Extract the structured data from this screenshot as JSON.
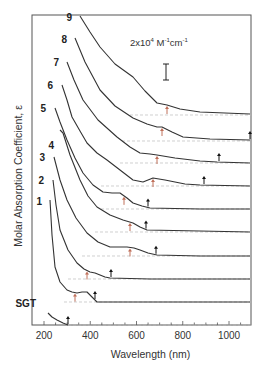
{
  "chart_data": {
    "type": "line",
    "title": "",
    "xlabel": "Wavelength (nm)",
    "ylabel": "Molar Absorption Coefficient, ε",
    "xlim": [
      150,
      1100
    ],
    "xticks": [
      200,
      400,
      600,
      800,
      1000
    ],
    "yticks": [],
    "grid": false,
    "legend": "curves labeled inline at left",
    "scale_bar": {
      "label_prefix": "2x10",
      "label_exp": "4",
      "label_units": " M",
      "units_exp1": "-1",
      "units_mid": "cm",
      "units_exp2": "-1",
      "value": "2x10^4 M^-1 cm^-1"
    },
    "annotations": "Red up-arrows mark absorption band maxima; black arrows mark absorption onsets. Curves offset vertically; dashed lines show each curve's zero baseline.",
    "series": [
      {
        "name": "9",
        "label_pos": [
          72,
          21
        ],
        "points": [
          [
            80,
            16
          ],
          [
            90,
            32
          ],
          [
            100,
            47
          ],
          [
            115,
            64
          ],
          [
            133,
            77
          ],
          [
            145,
            91
          ],
          [
            157,
            103
          ],
          [
            167,
            105
          ],
          [
            180,
            109
          ],
          [
            200,
            112
          ],
          [
            225,
            113
          ],
          [
            250,
            114
          ]
        ],
        "baseline_y": 115,
        "baseline_start_x": 130,
        "band_max_nm": 740,
        "band_max_x": 167,
        "onset_nm": null
      },
      {
        "name": "8",
        "label_pos": [
          67,
          43
        ],
        "points": [
          [
            75,
            38
          ],
          [
            85,
            62
          ],
          [
            100,
            90
          ],
          [
            115,
            106
          ],
          [
            133,
            118
          ],
          [
            147,
            124
          ],
          [
            157,
            127
          ],
          [
            162,
            127
          ],
          [
            172,
            132
          ],
          [
            183,
            137
          ],
          [
            210,
            139
          ],
          [
            250,
            140
          ]
        ],
        "baseline_y": 141,
        "baseline_start_x": 122,
        "band_max_nm": 710,
        "band_max_x": 162,
        "onset_nm": 1100,
        "onset_x": 250
      },
      {
        "name": "7",
        "label_pos": [
          59,
          66
        ],
        "points": [
          [
            67,
            62
          ],
          [
            74,
            80
          ],
          [
            83,
            100
          ],
          [
            98,
            120
          ],
          [
            117,
            137
          ],
          [
            130,
            147
          ],
          [
            140,
            153
          ],
          [
            150,
            154
          ],
          [
            157,
            155
          ],
          [
            175,
            158
          ],
          [
            200,
            161
          ],
          [
            217,
            162
          ],
          [
            250,
            163
          ]
        ],
        "baseline_y": 163,
        "baseline_start_x": 120,
        "band_max_nm": 690,
        "band_max_x": 157,
        "onset_nm": 960,
        "onset_x": 219
      },
      {
        "name": "6",
        "label_pos": [
          53,
          89
        ],
        "points": [
          [
            62,
            85
          ],
          [
            67,
            100
          ],
          [
            72,
            117
          ],
          [
            80,
            131
          ],
          [
            87,
            143
          ],
          [
            97,
            153
          ],
          [
            107,
            160
          ],
          [
            120,
            170
          ],
          [
            133,
            180
          ],
          [
            143,
            182
          ],
          [
            153,
            178
          ],
          [
            165,
            180
          ],
          [
            185,
            184
          ],
          [
            200,
            185
          ],
          [
            250,
            186
          ]
        ],
        "baseline_y": 186,
        "baseline_start_x": 101,
        "band_max_nm": 670,
        "band_max_x": 153,
        "onset_nm": 890,
        "onset_x": 204
      },
      {
        "name": "5",
        "label_pos": [
          46,
          112
        ],
        "points": [
          [
            55,
            108
          ],
          [
            60,
            122
          ],
          [
            67,
            140
          ],
          [
            75,
            158
          ],
          [
            83,
            173
          ],
          [
            93,
            185
          ],
          [
            103,
            192
          ],
          [
            112,
            193
          ],
          [
            120,
            193
          ],
          [
            127,
            198
          ],
          [
            133,
            203
          ],
          [
            142,
            206
          ],
          [
            150,
            208
          ],
          [
            200,
            209
          ],
          [
            250,
            209
          ]
        ],
        "baseline_y": 209,
        "baseline_start_x": 101,
        "band_max_nm": 545,
        "band_max_x": 124,
        "onset_nm": 650,
        "onset_x": 148
      },
      {
        "name": "4",
        "label_pos": [
          54,
          149
        ],
        "points": [
          [
            60,
            130
          ],
          [
            63,
            133
          ],
          [
            70,
            155
          ],
          [
            80,
            180
          ],
          [
            88,
            196
          ],
          [
            97,
            207
          ],
          [
            110,
            215
          ],
          [
            123,
            220
          ],
          [
            133,
            223
          ],
          [
            140,
            227
          ],
          [
            147,
            230
          ],
          [
            200,
            231
          ],
          [
            250,
            232
          ]
        ],
        "baseline_y": 232,
        "baseline_start_x": 95,
        "band_max_nm": 570,
        "band_max_x": 130,
        "onset_nm": 640,
        "onset_x": 146
      },
      {
        "name": "3",
        "label_pos": [
          45,
          161
        ],
        "points": [
          [
            54,
            157
          ],
          [
            60,
            180
          ],
          [
            67,
            200
          ],
          [
            76,
            218
          ],
          [
            87,
            233
          ],
          [
            98,
            242
          ],
          [
            110,
            247
          ],
          [
            120,
            247
          ],
          [
            127,
            247
          ],
          [
            134,
            248
          ],
          [
            140,
            250
          ],
          [
            148,
            253
          ],
          [
            157,
            255
          ],
          [
            200,
            256
          ],
          [
            250,
            256
          ]
        ],
        "baseline_y": 256,
        "baseline_start_x": 82,
        "band_max_nm": 570,
        "band_max_x": 130,
        "onset_nm": 680,
        "onset_x": 156
      },
      {
        "name": "2",
        "label_pos": [
          44,
          184
        ],
        "points": [
          [
            53,
            180
          ],
          [
            56,
            205
          ],
          [
            60,
            230
          ],
          [
            68,
            250
          ],
          [
            77,
            263
          ],
          [
            84,
            269
          ],
          [
            90,
            272
          ],
          [
            95,
            273
          ],
          [
            100,
            275
          ],
          [
            105,
            277
          ],
          [
            110,
            278
          ],
          [
            150,
            279
          ],
          [
            250,
            279
          ]
        ],
        "baseline_y": 279,
        "baseline_start_x": 68,
        "band_max_nm": 385,
        "band_max_x": 87,
        "onset_nm": 490,
        "onset_x": 111
      },
      {
        "name": "1",
        "label_pos": [
          42,
          205
        ],
        "points": [
          [
            50,
            200
          ],
          [
            52,
            235
          ],
          [
            55,
            267
          ],
          [
            60,
            282
          ],
          [
            67,
            290
          ],
          [
            72,
            292
          ],
          [
            77,
            293
          ],
          [
            82,
            292
          ],
          [
            87,
            292
          ],
          [
            92,
            297
          ],
          [
            97,
            302
          ],
          [
            150,
            302
          ],
          [
            250,
            302
          ]
        ],
        "baseline_y": 302,
        "baseline_start_x": 64,
        "band_max_nm": 335,
        "band_max_x": 75,
        "onset_nm": 420,
        "onset_x": 95
      },
      {
        "name": "SGT",
        "label_pos": [
          36,
          307
        ],
        "points": [
          [
            48,
            313
          ],
          [
            52,
            317
          ],
          [
            57,
            320
          ],
          [
            63,
            323
          ],
          [
            68,
            325
          ]
        ],
        "baseline_y": 325,
        "baseline_start_x": 68,
        "band_max_nm": null,
        "onset_nm": 300,
        "onset_x": 68
      }
    ]
  },
  "axes": {
    "xlabel": "Wavelength (nm)",
    "ylabel": "Molar Absorption Coefficient, ε",
    "xtick_labels": [
      "200",
      "400",
      "600",
      "800",
      "1000"
    ]
  },
  "colors": {
    "curve": "#333333",
    "frame": "#555555",
    "band_max_arrow": "#c0705a",
    "onset_arrow": "#111111",
    "baseline": "#bbbbbb"
  }
}
